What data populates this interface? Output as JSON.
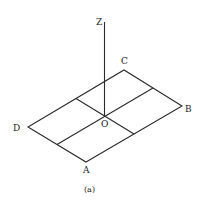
{
  "figure": {
    "caption": "(a)",
    "labels": {
      "z_axis": "Z",
      "origin": "O",
      "A": "A",
      "B": "B",
      "C": "C",
      "D": "D"
    },
    "colors": {
      "stroke": "#2a2a2a",
      "background": "#ffffff"
    }
  }
}
